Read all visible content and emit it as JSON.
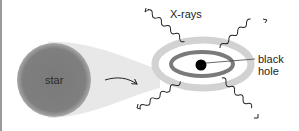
{
  "diagram": {
    "labels": {
      "star": "star",
      "xrays": "X-rays",
      "black_hole_line1": "black",
      "black_hole_line2": "hole"
    },
    "colors": {
      "star": "#7d7d7d",
      "stream": "#e6e6e6",
      "disk_outer": "#d4d4d4",
      "disk_inner": "#7a7a7a",
      "black_hole": "#000000",
      "border": "#9a9a9a"
    }
  }
}
